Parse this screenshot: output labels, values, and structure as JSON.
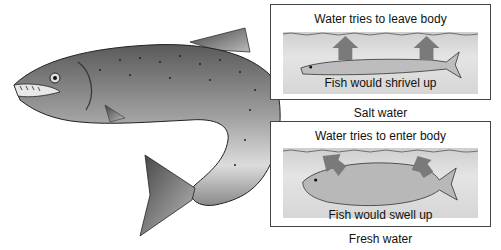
{
  "diagram": {
    "main_subject": "Trout / salmon illustration",
    "panels": [
      {
        "id": "salt",
        "title": "Water tries to leave body",
        "caption_inside": "Fish would shrivel up",
        "label_below": "Salt water",
        "arrow_direction": "up-out"
      },
      {
        "id": "fresh",
        "title": "Water tries to enter body",
        "caption_inside": "Fish would swell up",
        "label_below": "Fresh water",
        "arrow_direction": "down-in"
      }
    ],
    "colors": {
      "arrow": "#7a7a7a",
      "water": "#d6d6d6",
      "border": "#444444"
    }
  }
}
